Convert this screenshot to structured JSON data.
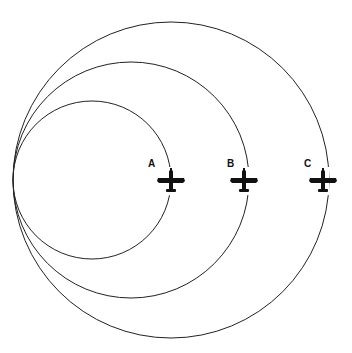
{
  "diagram": {
    "colors": {
      "line": "#222222",
      "plane": "#111111",
      "background": "#ffffff"
    },
    "circles": [
      {
        "id": "A",
        "cx": 92,
        "cy": 180,
        "r": 79
      },
      {
        "id": "B",
        "cx": 131,
        "cy": 180,
        "r": 118
      },
      {
        "id": "C",
        "cx": 171,
        "cy": 180,
        "r": 158
      }
    ],
    "planes": [
      {
        "label": "A",
        "icon": "airplane-icon",
        "x": 171,
        "y": 180
      },
      {
        "label": "B",
        "icon": "airplane-icon",
        "x": 244,
        "y": 180
      },
      {
        "label": "C",
        "icon": "airplane-icon",
        "x": 323,
        "y": 180
      }
    ]
  }
}
